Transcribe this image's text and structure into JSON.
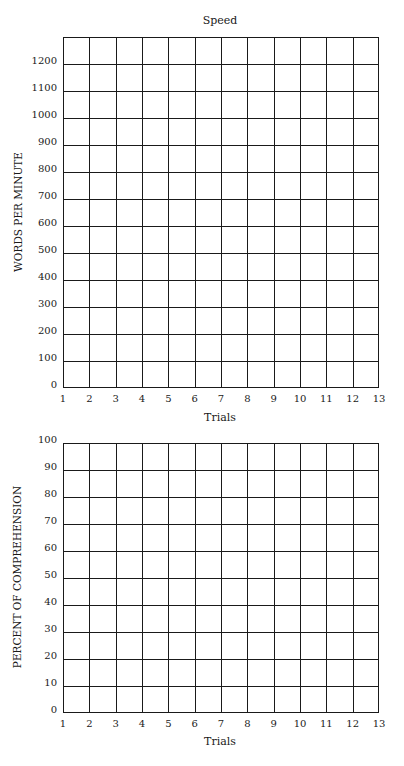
{
  "chart_data": [
    {
      "type": "line",
      "title": "Speed",
      "xlabel": "Trials",
      "ylabel": "WORDS PER MINUTE",
      "x_ticks": [
        "1",
        "2",
        "3",
        "4",
        "5",
        "6",
        "7",
        "8",
        "9",
        "10",
        "11",
        "12",
        "13"
      ],
      "y_ticks": [
        "0",
        "100",
        "200",
        "300",
        "400",
        "500",
        "600",
        "700",
        "800",
        "900",
        "1000",
        "1100",
        "1200"
      ],
      "xlim": [
        1,
        13
      ],
      "ylim": [
        0,
        1300
      ],
      "grid": true,
      "series": []
    },
    {
      "type": "line",
      "title": "",
      "xlabel": "Trials",
      "ylabel": "PERCENT OF COMPREHENSION",
      "x_ticks": [
        "1",
        "2",
        "3",
        "4",
        "5",
        "6",
        "7",
        "8",
        "9",
        "10",
        "11",
        "12",
        "13"
      ],
      "y_ticks": [
        "0",
        "10",
        "20",
        "30",
        "40",
        "50",
        "60",
        "70",
        "80",
        "90",
        "100"
      ],
      "xlim": [
        1,
        13
      ],
      "ylim": [
        0,
        100
      ],
      "grid": true,
      "series": []
    }
  ],
  "speed": {
    "title": "Speed",
    "xlabel": "Trials",
    "ylabel": "WORDS PER MINUTE",
    "x_ticks": [
      "1",
      "2",
      "3",
      "4",
      "5",
      "6",
      "7",
      "8",
      "9",
      "10",
      "11",
      "12",
      "13"
    ],
    "y_ticks": [
      "0",
      "100",
      "200",
      "300",
      "400",
      "500",
      "600",
      "700",
      "800",
      "900",
      "1000",
      "1100",
      "1200"
    ]
  },
  "comprehension": {
    "xlabel": "Trials",
    "ylabel": "PERCENT OF COMPREHENSION",
    "x_ticks": [
      "1",
      "2",
      "3",
      "4",
      "5",
      "6",
      "7",
      "8",
      "9",
      "10",
      "11",
      "12",
      "13"
    ],
    "y_ticks": [
      "0",
      "10",
      "20",
      "30",
      "40",
      "50",
      "60",
      "70",
      "80",
      "90",
      "100"
    ]
  }
}
